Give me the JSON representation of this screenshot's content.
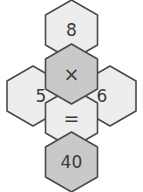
{
  "puzzle": {
    "kind": "hexagon-equation-cross",
    "equation_text": "5 × 8 = 40",
    "background_color": "#ffffff",
    "outline_color": "#4a4a4a",
    "text_color": "#3a3a3a",
    "fill_light": "#ededed",
    "fill_medium": "#c9c9c9",
    "cells": [
      {
        "id": "top",
        "label": "8",
        "role": "operand",
        "fill": "#ededed",
        "cx": 71.5,
        "cy": 30,
        "text_dx": 0,
        "text_dy": 0,
        "font_size": 17
      },
      {
        "id": "center-upper",
        "label": "×",
        "role": "operator-multiply",
        "fill": "#c9c9c9",
        "cx": 71.5,
        "cy": 74,
        "text_dx": 0,
        "text_dy": 0,
        "font_size": 19
      },
      {
        "id": "left",
        "label": "5",
        "role": "operand",
        "fill": "#ededed",
        "cx": 33,
        "cy": 96,
        "text_dx": 8,
        "text_dy": 0,
        "font_size": 17
      },
      {
        "id": "right",
        "label": "6",
        "role": "operand",
        "fill": "#ededed",
        "cx": 110,
        "cy": 96,
        "text_dx": -8,
        "text_dy": 0,
        "font_size": 17
      },
      {
        "id": "center-lower",
        "label": "=",
        "role": "operator-equals",
        "fill": "#ededed",
        "cx": 71.5,
        "cy": 118,
        "text_dx": 0,
        "text_dy": 0,
        "font_size": 19
      },
      {
        "id": "bottom",
        "label": "40",
        "role": "result",
        "fill": "#c9c9c9",
        "cx": 71.5,
        "cy": 162,
        "text_dx": 0,
        "text_dy": 0,
        "font_size": 17
      }
    ]
  }
}
